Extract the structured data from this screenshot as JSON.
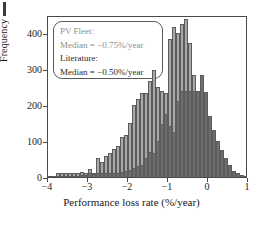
{
  "chart_data": {
    "type": "bar",
    "title": "",
    "subtitle": "",
    "xlabel": "Performance loss rate (%/year)",
    "ylabel": "Frequency",
    "xlim": [
      -4,
      1
    ],
    "ylim": [
      0,
      450
    ],
    "bin_width": 0.1,
    "grid": false,
    "legend_position": "upper-left",
    "xticks": [
      -4,
      -3,
      -2,
      -1,
      0,
      1
    ],
    "xtick_labels": [
      "−4",
      "−3",
      "−2",
      "−1",
      "0",
      "1"
    ],
    "yticks": [
      0,
      100,
      200,
      300,
      400
    ],
    "ytick_labels": [
      "0",
      "100",
      "200",
      "300",
      "400"
    ],
    "bin_left_edges": [
      -4.0,
      -3.9,
      -3.8,
      -3.7,
      -3.6,
      -3.5,
      -3.4,
      -3.3,
      -3.2,
      -3.1,
      -3.0,
      -2.9,
      -2.8,
      -2.7,
      -2.6,
      -2.5,
      -2.4,
      -2.3,
      -2.2,
      -2.1,
      -2.0,
      -1.9,
      -1.8,
      -1.7,
      -1.6,
      -1.5,
      -1.4,
      -1.3,
      -1.2,
      -1.1,
      -1.0,
      -0.9,
      -0.8,
      -0.7,
      -0.6,
      -0.5,
      -0.4,
      -0.3,
      -0.2,
      -0.1,
      0.0,
      0.1,
      0.2,
      0.3,
      0.4,
      0.5,
      0.6,
      0.7,
      0.8,
      0.9
    ],
    "series": [
      {
        "name": "PV Fleet",
        "color": "#a8a8a8",
        "median": -0.75,
        "median_label": "Median = −0.75%/year",
        "values": [
          4,
          2,
          10,
          10,
          10,
          10,
          12,
          10,
          14,
          10,
          22,
          12,
          52,
          42,
          58,
          68,
          78,
          85,
          112,
          118,
          150,
          200,
          218,
          232,
          232,
          268,
          296,
          250,
          240,
          232,
          382,
          416,
          400,
          424,
          440,
          372,
          282,
          236,
          170,
          130,
          100,
          76,
          52,
          50,
          32,
          16,
          10,
          6,
          6,
          4
        ]
      },
      {
        "name": "Literature",
        "color": "#6e6e6e",
        "median": -0.5,
        "median_label": "Median = −0.50%/year",
        "values": [
          2,
          1,
          2,
          2,
          2,
          3,
          4,
          4,
          6,
          6,
          10,
          8,
          10,
          10,
          12,
          12,
          12,
          12,
          14,
          16,
          20,
          26,
          30,
          34,
          52,
          70,
          66,
          100,
          146,
          174,
          142,
          124,
          210,
          238,
          240,
          240,
          240,
          240,
          282,
          236,
          170,
          130,
          100,
          76,
          52,
          32,
          16,
          10,
          6,
          4
        ]
      }
    ]
  },
  "legend": {
    "fleet_title": "PV Fleet:",
    "fleet_median": "Median = −0.75%/year",
    "literature_title": "Literature:",
    "literature_median": "Median = −0.50%/year"
  }
}
